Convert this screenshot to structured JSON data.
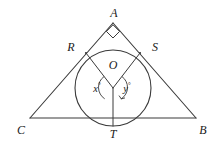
{
  "figure": {
    "type": "euclidean-geometry-diagram",
    "stroke_color": "#3a3a3a",
    "label_color": "#1a1a1a",
    "background_color": "#ffffff",
    "vertices": {
      "A": {
        "label": "A",
        "x": 113,
        "y": 23,
        "label_x": 114,
        "label_y": 13
      },
      "B": {
        "label": "B",
        "x": 196,
        "y": 118,
        "label_x": 203,
        "label_y": 130
      },
      "C": {
        "label": "C",
        "x": 30,
        "y": 118,
        "label_x": 21,
        "label_y": 130
      }
    },
    "circle": {
      "center_x": 113,
      "center_y": 88,
      "radius": 38
    },
    "center_point": {
      "label": "O",
      "x": 113,
      "y": 88,
      "label_x": 113,
      "label_y": 65
    },
    "tangent_points": {
      "R": {
        "label": "R",
        "x": 86,
        "y": 53,
        "label_x": 71,
        "label_y": 47
      },
      "S": {
        "label": "S",
        "x": 140,
        "y": 53,
        "label_x": 155,
        "label_y": 47
      },
      "T": {
        "label": "T",
        "x": 113,
        "y": 126,
        "label_x": 113,
        "label_y": 134
      }
    },
    "angles": [
      {
        "name": "x",
        "label": "x",
        "degree_symbol": "°",
        "label_x": 97,
        "label_y": 88,
        "vertex": "O",
        "between": "R-O-T"
      },
      {
        "name": "y",
        "label": "y",
        "degree_symbol": "°",
        "label_x": 127,
        "label_y": 88,
        "vertex": "O",
        "between": "T-O-S"
      }
    ],
    "right_angle_marker": {
      "at": "A",
      "size": 9,
      "shape": "square-rotated"
    },
    "segments": [
      {
        "name": "side-CA",
        "from": "C",
        "to": "A"
      },
      {
        "name": "side-AB",
        "from": "A",
        "to": "B"
      },
      {
        "name": "side-CB",
        "from": "C",
        "to": "B"
      },
      {
        "name": "radius-OR",
        "from": "O",
        "to": "R"
      },
      {
        "name": "radius-OS",
        "from": "O",
        "to": "S"
      },
      {
        "name": "radius-OT",
        "from": "O",
        "to": "T"
      }
    ]
  }
}
